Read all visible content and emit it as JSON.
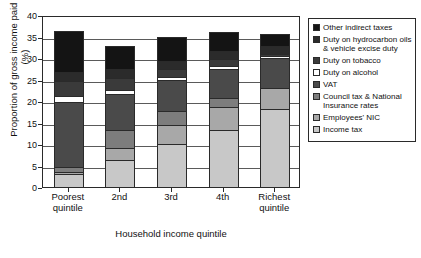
{
  "chart_data": {
    "type": "bar",
    "subtype": "stacked-bar",
    "title": "",
    "xlabel": "Household income quintile",
    "ylabel": "Proportion of gross income paid in tax (%)",
    "categories": [
      "Poorest quintile",
      "2nd",
      "3rd",
      "4th",
      "Richest quintile"
    ],
    "ylim": [
      0,
      40
    ],
    "yticks": [
      0,
      5,
      10,
      15,
      20,
      25,
      30,
      35,
      40
    ],
    "ytick_labels": [
      "0",
      "5",
      "10",
      "15",
      "20",
      "25",
      "30",
      "35",
      "40"
    ],
    "grid": true,
    "legend_position": "right",
    "stack_order_bottom_to_top": [
      "Income tax",
      "Employees' NIC",
      "Council tax & National Insurance rates",
      "VAT",
      "Duty on alcohol",
      "Duty on tobacco",
      "Duty on hydrocarbon oils & vehicle excise duty",
      "Other indirect taxes"
    ],
    "series": [
      {
        "name": "Income tax",
        "color": "#c8c8c8",
        "values": [
          3.0,
          6.2,
          10.0,
          13.2,
          18.2
        ]
      },
      {
        "name": "Employees' NIC",
        "color": "#a8a8a8",
        "values": [
          0.5,
          2.9,
          4.5,
          5.4,
          4.9
        ]
      },
      {
        "name": "Council tax & National Insurance rates",
        "color": "#7d7d7d",
        "values": [
          1.2,
          4.1,
          3.2,
          2.0,
          0.0
        ]
      },
      {
        "name": "VAT",
        "color": "#4a4a4a",
        "values": [
          15.0,
          8.5,
          7.2,
          6.9,
          6.8
        ]
      },
      {
        "name": "Duty on alcohol",
        "color": "#ffffff",
        "values": [
          1.5,
          0.8,
          0.8,
          0.7,
          0.5
        ]
      },
      {
        "name": "Duty on tobacco",
        "color": "#3a3a3a",
        "values": [
          3.5,
          2.9,
          1.8,
          1.6,
          0.6
        ]
      },
      {
        "name": "Duty on hydrocarbon oils & vehicle excise duty",
        "color": "#2b2b2b",
        "values": [
          2.1,
          2.1,
          1.8,
          1.9,
          1.7
        ]
      },
      {
        "name": "Other indirect taxes",
        "color": "#141414",
        "values": [
          9.5,
          5.3,
          5.7,
          4.4,
          3.0
        ]
      }
    ],
    "totals": [
      36.3,
      32.8,
      35.0,
      36.1,
      35.7
    ]
  },
  "legend": {
    "items": [
      {
        "label": "Other indirect taxes",
        "color": "#141414"
      },
      {
        "label": "Duty on hydrocarbon oils & vehicle excise duty",
        "color": "#2b2b2b"
      },
      {
        "label": "Duty on tobacco",
        "color": "#3a3a3a"
      },
      {
        "label": "Duty on alcohol",
        "color": "#ffffff"
      },
      {
        "label": "VAT",
        "color": "#4a4a4a"
      },
      {
        "label": "Council tax & National Insurance rates",
        "color": "#7d7d7d"
      },
      {
        "label": "Employees' NIC",
        "color": "#a8a8a8"
      },
      {
        "label": "Income tax",
        "color": "#c8c8c8"
      }
    ]
  }
}
